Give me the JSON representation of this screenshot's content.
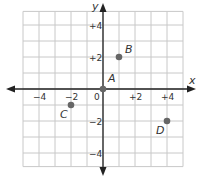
{
  "axes": {
    "x_label": "x",
    "y_label": "y",
    "origin_label": "0",
    "x_ticks": [
      {
        "value": -4,
        "label": "−4"
      },
      {
        "value": -2,
        "label": "−2"
      },
      {
        "value": 2,
        "label": "+2"
      },
      {
        "value": 4,
        "label": "+4"
      }
    ],
    "y_ticks": [
      {
        "value": 4,
        "label": "+4"
      },
      {
        "value": 2,
        "label": "+2"
      },
      {
        "value": -2,
        "label": "−2"
      },
      {
        "value": -4,
        "label": "−4"
      }
    ]
  },
  "points": [
    {
      "name": "A",
      "x": 0,
      "y": 0
    },
    {
      "name": "B",
      "x": 1,
      "y": 2
    },
    {
      "name": "C",
      "x": -2,
      "y": -1
    },
    {
      "name": "D",
      "x": 4,
      "y": -2
    }
  ],
  "colors": {
    "grid": "#c8c8c8",
    "axis": "#222222",
    "point": "#666666"
  }
}
